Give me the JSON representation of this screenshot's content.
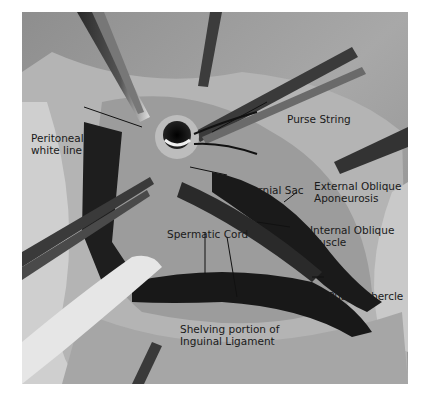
{
  "figure": {
    "colors": {
      "background": "#9a9a9a",
      "tissue_light": "#d8d8d8",
      "muscle_dark": "#1e1e1e",
      "label_text": "#1a1a1a"
    },
    "labels": [
      {
        "id": "peritoneal",
        "lines": [
          "Peritoneal",
          "white line"
        ]
      },
      {
        "id": "purse",
        "lines": [
          "Purse String"
        ]
      },
      {
        "id": "hernial",
        "lines": [
          "Hernial Sac"
        ]
      },
      {
        "id": "external",
        "lines": [
          "External Oblique",
          "Aponeurosis"
        ]
      },
      {
        "id": "internal",
        "lines": [
          "Internal Oblique",
          "Muscle"
        ]
      },
      {
        "id": "spermatic",
        "lines": [
          "Spermatic Cord"
        ]
      },
      {
        "id": "pubic",
        "lines": [
          "Pubic Tubercle"
        ]
      },
      {
        "id": "shelving",
        "lines": [
          "Shelving portion of",
          "Inguinal Ligament"
        ]
      }
    ]
  }
}
